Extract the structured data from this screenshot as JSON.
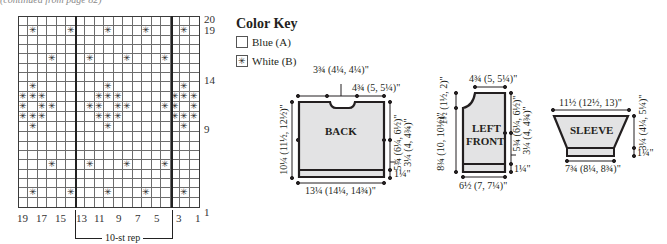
{
  "header_note": "(continued from page 82)",
  "chart": {
    "columns": 19,
    "rows": 20,
    "column_labels": [
      "19",
      "17",
      "15",
      "13",
      "11",
      "9",
      "7",
      "5",
      "3",
      "1"
    ],
    "row_labels": [
      "20",
      "19",
      "14",
      "9",
      "1"
    ],
    "repeat_label": "10-st rep",
    "repeat_start_col": 13,
    "repeat_end_col": 4,
    "symbol": "✳",
    "white_stitches": {
      "19": [
        18,
        14,
        10,
        6,
        2
      ],
      "16": [
        16,
        12,
        8,
        4
      ],
      "13": [
        18,
        10,
        2
      ],
      "12": [
        19,
        18,
        17,
        11,
        10,
        9,
        3,
        2,
        1
      ],
      "11": [
        19,
        17,
        16,
        12,
        11,
        9,
        8,
        4,
        3,
        1
      ],
      "10": [
        19,
        18,
        17,
        11,
        10,
        9,
        3,
        2,
        1
      ],
      "9": [
        18,
        10,
        2
      ],
      "5": [
        16,
        12,
        8,
        4
      ],
      "2": [
        18,
        14,
        10,
        6,
        2
      ]
    }
  },
  "color_key": {
    "title": "Color Key",
    "items": [
      {
        "swatch": "",
        "label": "Blue (A)"
      },
      {
        "swatch": "✳",
        "label": "White (B)"
      }
    ]
  },
  "schematics": {
    "back": {
      "label": "BACK",
      "neck_width": "3¾ (4¼, 4¼)\"",
      "shoulder_width": "4¾ (5, 5¼)\"",
      "length": "10¼ (11½, 12½)\"",
      "armhole_depth": "5¾ (6¼, 6½)\"",
      "side_to_armhole": "3¼ (4, 4¾)\"",
      "ribbing": "1¼\"",
      "width": "13¼ (14¼, 14¾)\""
    },
    "left_front": {
      "label_line1": "LEFT",
      "label_line2": "FRONT",
      "shoulder_width": "4¾ (5, 5¼)\"",
      "neck_depth": "1½ (1½, 2)\"",
      "body_length": "8¾ (10, 10½)\"",
      "armhole_depth": "5¾ (6¼, 6½)\"",
      "side_to_armhole": "3¼ (4, 4¾)\"",
      "ribbing": "1¼\"",
      "width": "6½ (7, 7¼)\""
    },
    "sleeve": {
      "label": "SLEEVE",
      "top_width": "11½ (12½, 13)\"",
      "length": "3¼ (4¼, 5¼)\"",
      "ribbing": "1¼\"",
      "cuff_width": "7¾ (8¼, 8¾)\""
    }
  }
}
